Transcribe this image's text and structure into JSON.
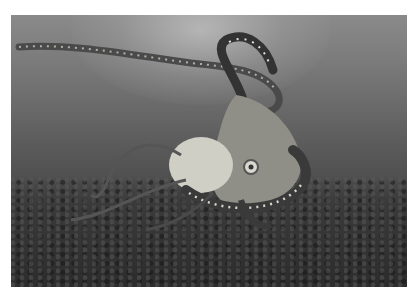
{
  "image": {
    "subject": "octopus swimming underwater above rocky seafloor",
    "style": "grayscale photograph",
    "colors": {
      "background": "#ffffff",
      "water_top": "#8a8a8a",
      "water_bottom": "#2e2e2e",
      "octopus_light": "#d8d8d0",
      "octopus_dark": "#3a3a3a"
    }
  }
}
